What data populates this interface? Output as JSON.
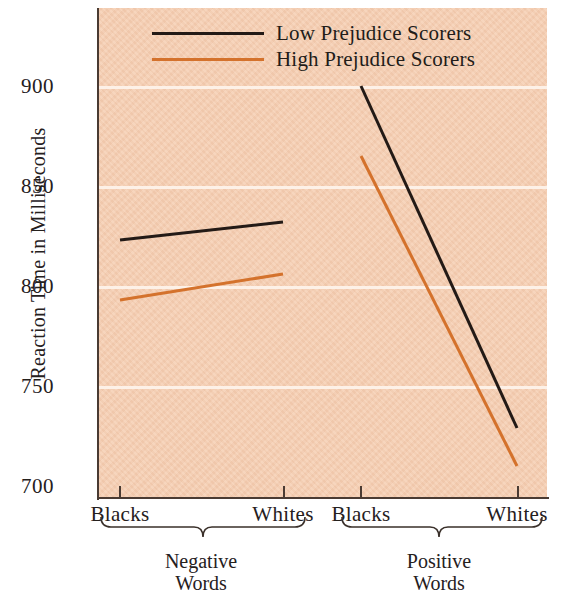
{
  "chart_data": {
    "type": "line",
    "title": "",
    "xlabel": "",
    "ylabel": "Reaction Time in Milliseconds",
    "ylim": [
      700,
      920
    ],
    "yticks": [
      700,
      750,
      800,
      850,
      900
    ],
    "ytick_labels": [
      "700",
      "750",
      "800",
      "850",
      "900"
    ],
    "grid": true,
    "legend_position": "top-center",
    "categories": [
      "Blacks",
      "Whites",
      "Blacks",
      "Whites"
    ],
    "groups": [
      {
        "label": "Negative\nWords",
        "categories": [
          "Blacks",
          "Whites"
        ]
      },
      {
        "label": "Positive\nWords",
        "categories": [
          "Blacks",
          "Whites"
        ]
      }
    ],
    "series": [
      {
        "name": "Low Prejudice Scorers",
        "color": "#231a16",
        "values": [
          823,
          832,
          900,
          729
        ],
        "segments": [
          {
            "group": "Negative Words",
            "points": [
              {
                "x": "Blacks",
                "y": 823
              },
              {
                "x": "Whites",
                "y": 832
              }
            ]
          },
          {
            "group": "Positive Words",
            "points": [
              {
                "x": "Blacks",
                "y": 900
              },
              {
                "x": "Whites",
                "y": 729
              }
            ]
          }
        ]
      },
      {
        "name": "High Prejudice Scorers",
        "color": "#d4722c",
        "values": [
          793,
          806,
          865,
          710
        ],
        "segments": [
          {
            "group": "Negative Words",
            "points": [
              {
                "x": "Blacks",
                "y": 793
              },
              {
                "x": "Whites",
                "y": 806
              }
            ]
          },
          {
            "group": "Positive Words",
            "points": [
              {
                "x": "Blacks",
                "y": 865
              },
              {
                "x": "Whites",
                "y": 710
              }
            ]
          }
        ]
      }
    ]
  },
  "legend": {
    "items": [
      {
        "label": "Low Prejudice Scorers",
        "color": "#231a16"
      },
      {
        "label": "High Prejudice Scorers",
        "color": "#d4722c"
      }
    ]
  },
  "axes": {
    "y_title": "Reaction Time in Milliseconds",
    "y_ticks": [
      "900",
      "850",
      "800",
      "750",
      "700"
    ],
    "x_ticks": [
      "Blacks",
      "Whites",
      "Blacks",
      "Whites"
    ],
    "group_labels": [
      "Negative\nWords",
      "Positive\nWords"
    ]
  },
  "colors": {
    "panel_background": "#f6cfb4",
    "gridline": "#fdf2ea",
    "axis": "#4a3b33",
    "series_low": "#231a16",
    "series_high": "#d4722c",
    "text": "#25201d"
  }
}
